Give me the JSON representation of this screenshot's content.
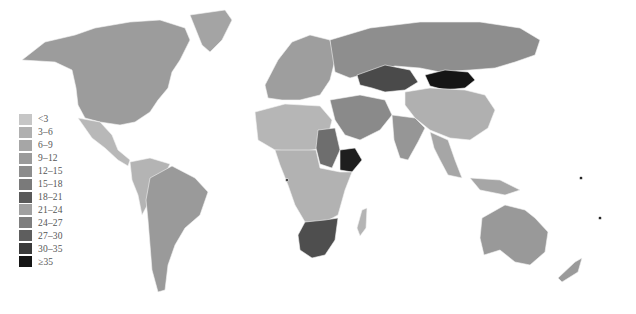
{
  "map": {
    "type": "choropleth-world",
    "legend": {
      "items": [
        {
          "label": "<3",
          "color": "#c6c6c6"
        },
        {
          "label": "3–6",
          "color": "#b0b0b0"
        },
        {
          "label": "6–9",
          "color": "#a6a6a6"
        },
        {
          "label": "9–12",
          "color": "#9a9a9a"
        },
        {
          "label": "12–15",
          "color": "#8c8c8c"
        },
        {
          "label": "15–18",
          "color": "#7a7a7a"
        },
        {
          "label": "18–21",
          "color": "#5a5a5a"
        },
        {
          "label": "21–24",
          "color": "#a0a0a0"
        },
        {
          "label": "24–27",
          "color": "#7e7e7e"
        },
        {
          "label": "27–30",
          "color": "#5e5e5e"
        },
        {
          "label": "30–35",
          "color": "#3a3a3a"
        },
        {
          "label": "≥35",
          "color": "#151515"
        }
      ]
    },
    "regions": {
      "north_america": "#9c9c9c",
      "greenland": "#a4a4a4",
      "mexico_central_america": "#b8b8b8",
      "south_america_north": "#b4b4b4",
      "brazil_argentina": "#9a9a9a",
      "europe": "#9e9e9e",
      "russia": "#8e8e8e",
      "kazakhstan": "#4a4a4a",
      "mongolia": "#151515",
      "china": "#b0b0b0",
      "middle_east": "#8a8a8a",
      "north_africa": "#b6b6b6",
      "sudan": "#6e6e6e",
      "ethiopia": "#1e1e1e",
      "central_africa": "#b2b2b2",
      "southern_africa": "#4e4e4e",
      "india": "#969696",
      "southeast_asia": "#a6a6a6",
      "australia": "#999999",
      "new_zealand": "#9a9a9a",
      "madagascar": "#b4b4b4"
    }
  }
}
